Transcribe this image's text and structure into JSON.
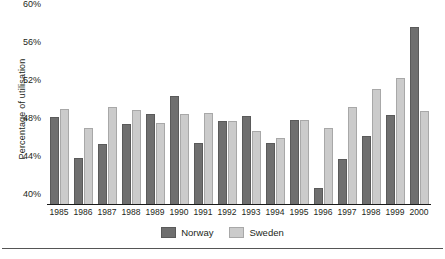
{
  "chart_data": {
    "type": "bar",
    "title": "",
    "subtitle": "",
    "xlabel": "",
    "ylabel": "Percentage of utilisation",
    "ylim": [
      40,
      60
    ],
    "yticks": [
      "40%",
      "44%",
      "48%",
      "52%",
      "56%",
      "60%"
    ],
    "ytick_values": [
      40,
      44,
      48,
      52,
      56,
      60
    ],
    "grid": false,
    "legend_position": "bottom-center",
    "categories": [
      "1985",
      "1986",
      "1987",
      "1988",
      "1989",
      "1990",
      "1991",
      "1992",
      "1993",
      "1994",
      "1995",
      "1996",
      "1997",
      "1998",
      "1999",
      "2000"
    ],
    "series": [
      {
        "name": "Norway",
        "color": "#6f6f6f",
        "values": [
          49.2,
          44.8,
          46.3,
          48.4,
          49.5,
          51.4,
          46.4,
          48.7,
          49.3,
          46.4,
          48.8,
          41.7,
          44.7,
          47.2,
          49.4,
          58.6
        ]
      },
      {
        "name": "Sweden",
        "color": "#cbcbcb",
        "values": [
          50.0,
          48.0,
          50.2,
          49.9,
          48.5,
          49.5,
          49.6,
          48.7,
          47.7,
          47.0,
          48.8,
          48.0,
          50.2,
          52.1,
          53.3,
          49.8
        ]
      }
    ]
  },
  "legend": {
    "items": [
      {
        "label": "Norway",
        "key": "norway"
      },
      {
        "label": "Sweden",
        "key": "sweden"
      }
    ]
  }
}
